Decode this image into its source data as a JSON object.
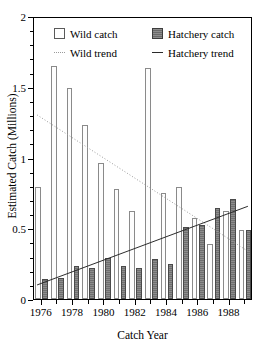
{
  "chart_data": {
    "type": "bar",
    "title": "",
    "xlabel": "Catch Year",
    "ylabel": "Estimated Catch (Millions)",
    "ylim": [
      0,
      2
    ],
    "yticks": [
      0,
      0.5,
      1,
      1.5,
      2
    ],
    "ytick_labels": [
      "0",
      "0.5",
      "1",
      "1.5",
      "2"
    ],
    "grid": false,
    "legend_position": "top-inside",
    "categories": [
      1976,
      1977,
      1978,
      1979,
      1980,
      1981,
      1982,
      1983,
      1984,
      1985,
      1986,
      1987,
      1988,
      1989
    ],
    "xtick_labels": [
      "1976",
      "1978",
      "1980",
      "1982",
      "1984",
      "1986",
      "1988"
    ],
    "xtick_values": [
      1976,
      1978,
      1980,
      1982,
      1984,
      1986,
      1988
    ],
    "series": [
      {
        "name": "Wild catch",
        "type": "bar",
        "color": "#ffffff",
        "edge_color": "#8a8a8a",
        "values": [
          0.79,
          1.65,
          1.49,
          1.23,
          0.96,
          0.78,
          0.62,
          1.63,
          0.75,
          0.79,
          0.57,
          0.39,
          0.62,
          0.49
        ]
      },
      {
        "name": "Hatchery catch",
        "type": "bar",
        "color": "#7b7b7b",
        "edge_color": "#4a4a4a",
        "values": [
          0.14,
          0.15,
          0.23,
          0.22,
          0.29,
          0.23,
          0.22,
          0.28,
          0.25,
          0.51,
          0.52,
          0.64,
          0.71,
          0.49
        ]
      },
      {
        "name": "Wild trend",
        "type": "line",
        "style": "dotted",
        "color": "#9a9a9a",
        "x": [
          1976,
          1989
        ],
        "y": [
          1.31,
          0.34
        ]
      },
      {
        "name": "Hatchery trend",
        "type": "line",
        "style": "solid",
        "color": "#2a2a2a",
        "x": [
          1976,
          1989
        ],
        "y": [
          0.1,
          0.66
        ]
      }
    ]
  },
  "legend": {
    "wild_catch": "Wild catch",
    "hatchery_catch": "Hatchery catch",
    "wild_trend": "Wild trend",
    "hatchery_trend": "Hatchery trend"
  },
  "axes": {
    "y_title": "Estimated Catch (Millions)",
    "x_title": "Catch Year"
  }
}
